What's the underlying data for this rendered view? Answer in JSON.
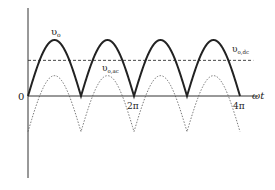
{
  "diagram": {
    "axis": {
      "origin_label": "0",
      "x_label": "ωt",
      "ticks": [
        {
          "label": "2π",
          "value_pi": 2
        },
        {
          "label": "4π",
          "value_pi": 4
        }
      ]
    },
    "curves": [
      {
        "name": "v_o",
        "label_main": "υ",
        "label_sub": "o",
        "style": "solid-thick",
        "kind": "abs-sine",
        "amplitude": 1.0
      },
      {
        "name": "v_o_dc",
        "label_main": "υ",
        "label_sub": "o,dc",
        "style": "dashed",
        "kind": "constant",
        "level": 0.6366
      },
      {
        "name": "v_o_ac",
        "label_main": "υ",
        "label_sub": "o,ac",
        "style": "dotted",
        "kind": "abs-sine-minus-mean",
        "amplitude": 1.0
      }
    ],
    "x_range_pi": [
      0,
      4.25
    ],
    "colors": {
      "ink": "#222222",
      "faint": "#555555"
    }
  }
}
